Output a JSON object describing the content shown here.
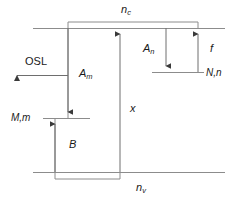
{
  "figure": {
    "type": "energy-band-diagram",
    "title": "",
    "background_color": "#ffffff",
    "line_color": "#808080",
    "text_color": "#1a1a1a",
    "width": 237,
    "height": 200
  },
  "bands": {
    "conduction": {
      "label": "n",
      "subscript": "c",
      "label_full": "nc",
      "y": 28
    },
    "valence": {
      "label": "n",
      "subscript": "v",
      "label_full": "nv",
      "y": 172
    }
  },
  "levels": {
    "trap_N": {
      "label": "N,n",
      "y": 72
    },
    "centre_M": {
      "label": "M,m",
      "y": 118
    }
  },
  "transitions": [
    {
      "name": "osl-emission",
      "label": "OSL",
      "direction": "left",
      "description": "Optically stimulated luminescence emission"
    },
    {
      "name": "recombination-Am",
      "label": "A",
      "subscript": "m",
      "label_full": "Am",
      "direction": "down",
      "description": "Recombination probability into centre M"
    },
    {
      "name": "retrapping-An",
      "label": "A",
      "subscript": "n",
      "label_full": "An",
      "direction": "down",
      "description": "Retrapping probability into trap N"
    },
    {
      "name": "optical-excitation-f",
      "label": "f",
      "direction": "up",
      "description": "Optical excitation rate from trap N"
    },
    {
      "name": "band-to-band-x",
      "label": "x",
      "direction": "up",
      "description": "Electron-hole pair creation rate"
    },
    {
      "name": "hole-trapping-B",
      "label": "B",
      "direction": "up",
      "description": "Hole trapping probability into centre M"
    }
  ],
  "labels": {
    "conduction_band": "n",
    "conduction_band_sub": "c",
    "valence_band": "n",
    "valence_band_sub": "v",
    "trap_level": "N,n",
    "centre_level": "M,m",
    "osl": "OSL",
    "a_m": "A",
    "a_m_sub": "m",
    "a_n": "A",
    "a_n_sub": "n",
    "f": "f",
    "x": "x",
    "b": "B"
  }
}
